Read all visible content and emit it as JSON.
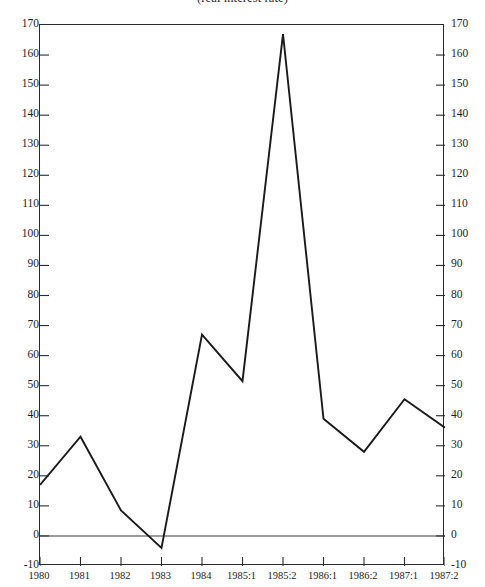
{
  "chart_data": {
    "type": "line",
    "title": "(real interest rate)",
    "xlabel": "",
    "ylabel": "",
    "categories": [
      "1980",
      "1981",
      "1982",
      "1983",
      "1984",
      "1985:1",
      "1985:2",
      "1986:1",
      "1986:2",
      "1987:1",
      "1987:2"
    ],
    "values": [
      17,
      33,
      8.5,
      -4,
      67,
      51.5,
      167,
      39,
      28,
      45.5,
      36
    ],
    "series": [
      {
        "name": "real interest rate",
        "values": [
          17,
          33,
          8.5,
          -4,
          67,
          51.5,
          167,
          39,
          28,
          45.5,
          36
        ]
      }
    ],
    "ylim": [
      -10,
      170
    ],
    "ytick_step": 10,
    "yticks": [
      -10,
      0,
      10,
      20,
      30,
      40,
      50,
      60,
      70,
      80,
      90,
      100,
      110,
      120,
      130,
      140,
      150,
      160,
      170
    ],
    "ytick_labels_left": [
      "-10",
      "0",
      "10",
      "20",
      "30",
      "40",
      "50",
      "60",
      "70",
      "80",
      "90",
      "100",
      "110",
      "120",
      "130",
      "140",
      "150",
      "160",
      "170"
    ],
    "ytick_labels_right": [
      "-10",
      "0",
      "10",
      "20",
      "30",
      "40",
      "50",
      "60",
      "70",
      "80",
      "90",
      "100",
      "110",
      "120",
      "130",
      "140",
      "150",
      "160",
      "170"
    ],
    "grid": false,
    "zero_line": true,
    "legend": null,
    "legend_position": "none",
    "line_color": "#1a1a1a",
    "axis_color": "#2b2b2b",
    "background": "#ffffff",
    "dual_axis": true
  }
}
